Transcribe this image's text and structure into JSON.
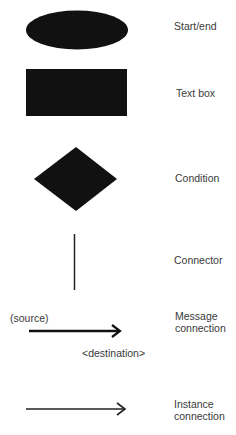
{
  "legend": [
    {
      "shape": "ellipse",
      "label": "Start/end"
    },
    {
      "shape": "rectangle",
      "label": "Text box"
    },
    {
      "shape": "diamond",
      "label": "Condition"
    },
    {
      "shape": "vertical-line",
      "label": "Connector"
    },
    {
      "shape": "arrow",
      "label_line1": "Message",
      "label_line2": "connection",
      "source_label": "(source)",
      "destination_label": "<destination>"
    },
    {
      "shape": "arrow-thin",
      "label_line1": "Instance",
      "label_line2": "connection"
    }
  ],
  "colors": {
    "shape_fill": "#111111",
    "text": "#3a3a3a",
    "background": "#ffffff"
  }
}
